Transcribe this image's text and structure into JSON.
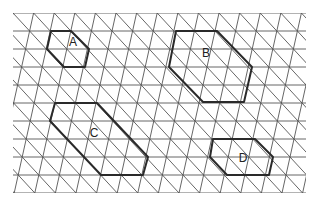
{
  "diagram": {
    "type": "triangular-isometric-grid",
    "grid": {
      "x_min": 13,
      "x_max": 306,
      "y_min": 13,
      "y_max": 193,
      "row_spacing": 18,
      "col_spacing": 20.6,
      "vertical_slant_dx": -4,
      "line_color": "#555555"
    },
    "shapes": [
      {
        "label": "A",
        "points": [
          [
            51,
            31
          ],
          [
            71,
            31
          ],
          [
            89,
            49
          ],
          [
            85,
            67
          ],
          [
            64,
            67
          ],
          [
            47,
            49
          ]
        ],
        "label_pos": [
          73,
          46
        ]
      },
      {
        "label": "B",
        "points": [
          [
            176,
            31
          ],
          [
            217,
            31
          ],
          [
            252,
            67
          ],
          [
            244,
            102
          ],
          [
            203,
            102
          ],
          [
            169,
            67
          ]
        ],
        "label_pos": [
          206,
          57
        ]
      },
      {
        "label": "C",
        "points": [
          [
            55,
            103
          ],
          [
            97,
            103
          ],
          [
            148,
            157
          ],
          [
            143,
            175
          ],
          [
            101,
            175
          ],
          [
            50,
            121
          ]
        ],
        "label_pos": [
          94,
          137
        ]
      },
      {
        "label": "D",
        "points": [
          [
            213,
            139
          ],
          [
            255,
            139
          ],
          [
            273,
            157
          ],
          [
            269,
            175
          ],
          [
            227,
            175
          ],
          [
            210,
            157
          ]
        ],
        "label_pos": [
          243,
          162
        ]
      }
    ],
    "shape_color": "#2a2a2a"
  }
}
